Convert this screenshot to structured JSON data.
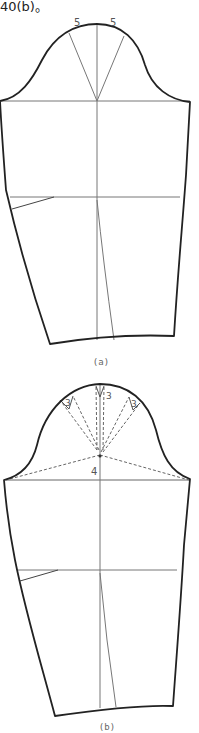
{
  "header": {
    "text": "40(b)。"
  },
  "figures": [
    {
      "id": "a",
      "caption": "(a)",
      "cap_labels": [
        "5",
        "5"
      ]
    },
    {
      "id": "b",
      "caption": "(b)",
      "cap_labels": [
        "3",
        "3",
        "3"
      ],
      "height_label": "4"
    }
  ],
  "colors": {
    "outline": "#222222",
    "guide": "#777777",
    "dashed": "#666666",
    "background": "#ffffff"
  }
}
